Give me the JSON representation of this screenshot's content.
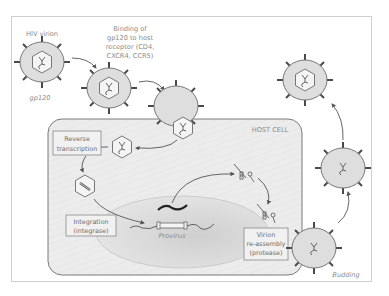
{
  "diagram": {
    "labels": {
      "hiv_virion": "HIV virion",
      "gp120": "gp120",
      "binding_line1": "Binding of",
      "binding_line2": "gp120 to host",
      "binding_line3": "receptor (CD4,",
      "binding_line4": "CXCR4, CCR5)",
      "host_cell": "HOST CELL",
      "reverse_line1": "Reverse",
      "reverse_line2": "transcription",
      "integration_line1": "Integration",
      "integration_line2": "(integrase)",
      "provirus": "Provirus",
      "reassembly_line1": "Virion",
      "reassembly_line2": "re-assembly",
      "reassembly_line3": "(protease)",
      "budding": "Budding"
    },
    "steps": [
      "HIV virion",
      "Binding of gp120 to host receptor (CD4, CXCR4, CCR5)",
      "Fusion / entry",
      "Reverse transcription",
      "Integration (integrase)",
      "Provirus",
      "Virion re-assembly (protease)",
      "Budding"
    ],
    "colors": {
      "virion_fill": "#dedede",
      "virion_stroke": "#6a6a6a",
      "spike": "#4a4a4a",
      "host_cell_fill": "#ececec",
      "host_cell_stroke": "#7a7a7a",
      "nucleus_fill": "#d8d8d8",
      "label_text": "#8a8a8a",
      "box_fill": "#f1f1f1",
      "box_stroke": "#8a8a8a",
      "arrow": "#555555"
    }
  }
}
